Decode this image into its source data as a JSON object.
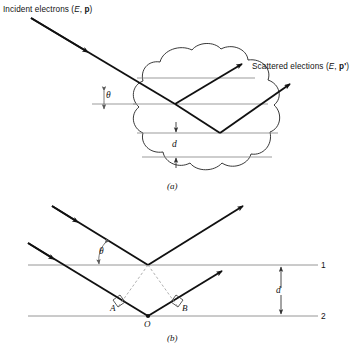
{
  "figure": {
    "title_semantic": "electron-diffraction-bragg-figure",
    "background_color": "#ffffff",
    "ray_color": "#111111",
    "plane_color": "#8a8a8a",
    "blob_color": "#222222",
    "dashed_color": "#9a9a9a"
  },
  "panel_a": {
    "caption": "(a)",
    "incident_label_prefix": "Incident electrons (",
    "incident_label_E": "E",
    "incident_label_sep": ", ",
    "incident_label_p": "p",
    "incident_label_suffix": ")",
    "scattered_label_prefix": "Scattered elections (",
    "scattered_label_E": "E",
    "scattered_label_sep": ", ",
    "scattered_label_p": "p'",
    "scattered_label_suffix": ")",
    "angle_label": "θ",
    "spacing_label": "d",
    "plane_count": 4
  },
  "panel_b": {
    "caption": "(b)",
    "angle_label": "θ",
    "spacing_label": "d",
    "plane_1_label": "1",
    "plane_2_label": "2",
    "point_A": "A",
    "point_O": "O",
    "point_B": "B"
  }
}
